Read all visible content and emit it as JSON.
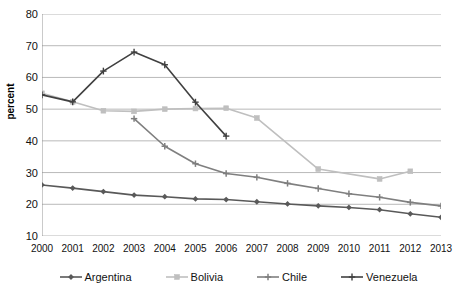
{
  "chart_data": {
    "type": "line",
    "title": "",
    "xlabel": "",
    "ylabel": "percent",
    "ylim": [
      10,
      80
    ],
    "ytick_step": 10,
    "yticks": [
      80,
      70,
      60,
      50,
      40,
      30,
      20,
      10
    ],
    "x": [
      2000,
      2001,
      2002,
      2003,
      2004,
      2005,
      2006,
      2007,
      2008,
      2009,
      2010,
      2011,
      2012,
      2013
    ],
    "grid": "horizontal",
    "legend_position": "bottom",
    "series": [
      {
        "name": "Argentina",
        "color": "#595959",
        "marker": "diamond",
        "x": [
          2000,
          2001,
          2002,
          2003,
          2004,
          2005,
          2006,
          2007,
          2008,
          2009,
          2010,
          2011,
          2012,
          2013
        ],
        "values": [
          26.1,
          25.1,
          24.0,
          22.9,
          22.4,
          21.7,
          21.5,
          20.8,
          20.1,
          19.5,
          19.0,
          18.3,
          17.0,
          15.9
        ]
      },
      {
        "name": "Bolivia",
        "color": "#bfbfbf",
        "marker": "square",
        "x": [
          2000,
          2001,
          2002,
          2003,
          2004,
          2005,
          2006,
          2007,
          2009,
          2011,
          2012
        ],
        "values": [
          55.0,
          52.3,
          49.5,
          49.3,
          50.0,
          50.2,
          50.3,
          47.2,
          31.1,
          28.0,
          30.4
        ]
      },
      {
        "name": "Chile",
        "color": "#7f7f7f",
        "marker": "plus",
        "x": [
          2003,
          2004,
          2005,
          2006,
          2007,
          2008,
          2009,
          2010,
          2011,
          2012,
          2013
        ],
        "values": [
          47.0,
          38.3,
          32.8,
          29.7,
          28.5,
          26.6,
          25.0,
          23.3,
          22.2,
          20.6,
          19.5
        ]
      },
      {
        "name": "Venezuela",
        "color": "#404040",
        "marker": "cross",
        "x": [
          2000,
          2001,
          2002,
          2003,
          2004,
          2005,
          2006
        ],
        "values": [
          54.5,
          52.3,
          62.0,
          68.0,
          64.0,
          52.2,
          41.5
        ]
      }
    ]
  },
  "axes": {
    "y_title": "percent"
  },
  "legend": {
    "items": [
      {
        "label": "Argentina"
      },
      {
        "label": "Bolivia"
      },
      {
        "label": "Chile"
      },
      {
        "label": "Venezuela"
      }
    ]
  }
}
